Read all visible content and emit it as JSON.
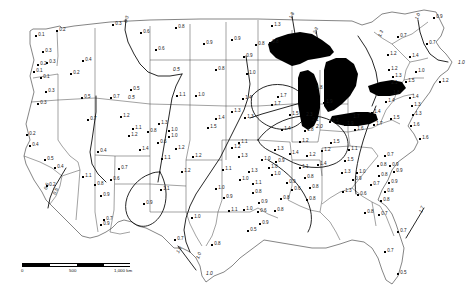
{
  "figure": {
    "kind": "contour-map",
    "region": "Contiguous United States",
    "background_color": "#ffffff",
    "line_color": "#333333",
    "contour_color": "#000000",
    "lake_fill_color": "#000000",
    "marker_color": "#000000"
  },
  "scale_bar": {
    "label_zero": "0",
    "label_mid": "500",
    "label_max": "1,000 km"
  },
  "chart_data": {
    "type": "scatter",
    "title": "",
    "xlabel": "",
    "ylabel": "",
    "value_range": [
      0.1,
      2.3
    ],
    "contour_levels": [
      0.3,
      0.5,
      0.7,
      1.0,
      1.3,
      1.8,
      2.0,
      2.1,
      2.3
    ],
    "contour_labels": [
      {
        "text": "0.3",
        "x": 124,
        "y": 22,
        "rot": -72
      },
      {
        "text": "0.5",
        "x": 173,
        "y": 68,
        "rot": 0
      },
      {
        "text": "0.5",
        "x": 128,
        "y": 96,
        "rot": 0
      },
      {
        "text": "0.5",
        "x": 53,
        "y": 194,
        "rot": -70
      },
      {
        "text": "0.5",
        "x": 44,
        "y": 189,
        "rot": -70
      },
      {
        "text": "1.0",
        "x": 176,
        "y": 252,
        "rot": -62
      },
      {
        "text": "1.0",
        "x": 196,
        "y": 258,
        "rot": -66
      },
      {
        "text": "1.0",
        "x": 206,
        "y": 272,
        "rot": 0
      },
      {
        "text": "1.8",
        "x": 289,
        "y": 18,
        "rot": -68
      },
      {
        "text": "2.3",
        "x": 313,
        "y": 33,
        "rot": -68
      },
      {
        "text": "1.3",
        "x": 378,
        "y": 36,
        "rot": -66
      },
      {
        "text": "1.0",
        "x": 415,
        "y": 19,
        "rot": -70
      },
      {
        "text": "1.0",
        "x": 458,
        "y": 61,
        "rot": 0
      },
      {
        "text": "1.7",
        "x": 419,
        "y": 212,
        "rot": -70
      },
      {
        "text": "2.0",
        "x": 316,
        "y": 125,
        "rot": 0
      },
      {
        "text": "2.1",
        "x": 312,
        "y": 118,
        "rot": 0
      }
    ],
    "points": [
      {
        "label": "0.1",
        "x": 36,
        "y": 36
      },
      {
        "label": "0.2",
        "x": 57,
        "y": 31
      },
      {
        "label": "0.3",
        "x": 43,
        "y": 52
      },
      {
        "label": "0.2",
        "x": 38,
        "y": 65
      },
      {
        "label": "0.3",
        "x": 47,
        "y": 63
      },
      {
        "label": "0.1",
        "x": 34,
        "y": 72
      },
      {
        "label": "0.1",
        "x": 41,
        "y": 78
      },
      {
        "label": "0.4",
        "x": 83,
        "y": 61
      },
      {
        "label": "0.2",
        "x": 71,
        "y": 74
      },
      {
        "label": "0.3",
        "x": 46,
        "y": 92
      },
      {
        "label": "0.3",
        "x": 38,
        "y": 104
      },
      {
        "label": "0.5",
        "x": 82,
        "y": 98
      },
      {
        "label": "0.7",
        "x": 111,
        "y": 98
      },
      {
        "label": "0.2",
        "x": 27,
        "y": 135
      },
      {
        "label": "0.4",
        "x": 30,
        "y": 146
      },
      {
        "label": "0.7",
        "x": 88,
        "y": 120
      },
      {
        "label": "0.4",
        "x": 98,
        "y": 152
      },
      {
        "label": "0.5",
        "x": 45,
        "y": 160
      },
      {
        "label": "0.4",
        "x": 55,
        "y": 168
      },
      {
        "label": "0.2",
        "x": 47,
        "y": 186
      },
      {
        "label": "0.9",
        "x": 101,
        "y": 196
      },
      {
        "label": "0.7",
        "x": 104,
        "y": 220
      },
      {
        "label": "0.8",
        "x": 95,
        "y": 185
      },
      {
        "label": "1.1",
        "x": 83,
        "y": 177
      },
      {
        "label": "0.7",
        "x": 119,
        "y": 169
      },
      {
        "label": "0.6",
        "x": 111,
        "y": 180
      },
      {
        "label": "0.9",
        "x": 101,
        "y": 225
      },
      {
        "label": "0.3",
        "x": 113,
        "y": 25
      },
      {
        "label": "0.6",
        "x": 141,
        "y": 33
      },
      {
        "label": "0.8",
        "x": 176,
        "y": 28
      },
      {
        "label": "0.6",
        "x": 156,
        "y": 50
      },
      {
        "label": "0.5",
        "x": 131,
        "y": 90
      },
      {
        "label": "1.1",
        "x": 177,
        "y": 96
      },
      {
        "label": "1.0",
        "x": 196,
        "y": 96
      },
      {
        "label": "1.2",
        "x": 121,
        "y": 117
      },
      {
        "label": "1.3",
        "x": 159,
        "y": 124
      },
      {
        "label": "0.8",
        "x": 148,
        "y": 132
      },
      {
        "label": "1.0",
        "x": 169,
        "y": 131
      },
      {
        "label": "1.0",
        "x": 169,
        "y": 137
      },
      {
        "label": "0.6",
        "x": 158,
        "y": 143
      },
      {
        "label": "1.1",
        "x": 133,
        "y": 129
      },
      {
        "label": "1.2",
        "x": 129,
        "y": 136
      },
      {
        "label": "1.4",
        "x": 140,
        "y": 150
      },
      {
        "label": "1.2",
        "x": 176,
        "y": 149
      },
      {
        "label": "1.1",
        "x": 162,
        "y": 159
      },
      {
        "label": "1.2",
        "x": 193,
        "y": 157
      },
      {
        "label": "0.9",
        "x": 144,
        "y": 204
      },
      {
        "label": "1.1",
        "x": 161,
        "y": 190
      },
      {
        "label": "1.2",
        "x": 182,
        "y": 172
      },
      {
        "label": "1.0",
        "x": 192,
        "y": 218
      },
      {
        "label": "0.7",
        "x": 175,
        "y": 240
      },
      {
        "label": "0.8",
        "x": 212,
        "y": 245
      },
      {
        "label": "1.1",
        "x": 223,
        "y": 170
      },
      {
        "label": "1.3",
        "x": 239,
        "y": 157
      },
      {
        "label": "1.2",
        "x": 232,
        "y": 148
      },
      {
        "label": "1.0",
        "x": 216,
        "y": 189
      },
      {
        "label": "0.9",
        "x": 224,
        "y": 198
      },
      {
        "label": "1.0",
        "x": 240,
        "y": 180
      },
      {
        "label": "1.1",
        "x": 229,
        "y": 211
      },
      {
        "label": "1.0",
        "x": 244,
        "y": 210
      },
      {
        "label": "0.8",
        "x": 253,
        "y": 193
      },
      {
        "label": "1.5",
        "x": 208,
        "y": 128
      },
      {
        "label": "1.4",
        "x": 216,
        "y": 119
      },
      {
        "label": "1.3",
        "x": 232,
        "y": 112
      },
      {
        "label": "1.3",
        "x": 245,
        "y": 118
      },
      {
        "label": "0.8",
        "x": 216,
        "y": 70
      },
      {
        "label": "0.9",
        "x": 204,
        "y": 44
      },
      {
        "label": "0.9",
        "x": 232,
        "y": 40
      },
      {
        "label": "0.8",
        "x": 256,
        "y": 45
      },
      {
        "label": "0.9",
        "x": 244,
        "y": 57
      },
      {
        "label": "1.0",
        "x": 247,
        "y": 74
      },
      {
        "label": "1.3",
        "x": 272,
        "y": 26
      },
      {
        "label": "0.8",
        "x": 270,
        "y": 43
      },
      {
        "label": "1.4",
        "x": 243,
        "y": 99
      },
      {
        "label": "1.7",
        "x": 278,
        "y": 97
      },
      {
        "label": "1.7",
        "x": 272,
        "y": 105
      },
      {
        "label": "1.8",
        "x": 314,
        "y": 89
      },
      {
        "label": "1.9",
        "x": 324,
        "y": 103
      },
      {
        "label": "1.5",
        "x": 290,
        "y": 115
      },
      {
        "label": "2.3",
        "x": 304,
        "y": 116
      },
      {
        "label": "2.3",
        "x": 330,
        "y": 122
      },
      {
        "label": "1.8",
        "x": 305,
        "y": 131
      },
      {
        "label": "1.7",
        "x": 351,
        "y": 118
      },
      {
        "label": "1.9",
        "x": 345,
        "y": 125
      },
      {
        "label": "1.6",
        "x": 355,
        "y": 130
      },
      {
        "label": "1.5",
        "x": 331,
        "y": 143
      },
      {
        "label": "1.2",
        "x": 300,
        "y": 142
      },
      {
        "label": "1.4",
        "x": 282,
        "y": 130
      },
      {
        "label": "1.1",
        "x": 239,
        "y": 143
      },
      {
        "label": "1.3",
        "x": 275,
        "y": 150
      },
      {
        "label": "1.4",
        "x": 290,
        "y": 154
      },
      {
        "label": "1.2",
        "x": 307,
        "y": 156
      },
      {
        "label": "1.0",
        "x": 262,
        "y": 160
      },
      {
        "label": "0.9",
        "x": 276,
        "y": 162
      },
      {
        "label": "1.1",
        "x": 300,
        "y": 168
      },
      {
        "label": "1.0",
        "x": 269,
        "y": 168
      },
      {
        "label": "1.0",
        "x": 272,
        "y": 175
      },
      {
        "label": "0.8",
        "x": 305,
        "y": 178
      },
      {
        "label": "0.9",
        "x": 287,
        "y": 183
      },
      {
        "label": "0.8",
        "x": 310,
        "y": 188
      },
      {
        "label": "0.6",
        "x": 292,
        "y": 190
      },
      {
        "label": "0.8",
        "x": 281,
        "y": 199
      },
      {
        "label": "0.8",
        "x": 307,
        "y": 200
      },
      {
        "label": "0.8",
        "x": 275,
        "y": 211
      },
      {
        "label": "0.9",
        "x": 260,
        "y": 224
      },
      {
        "label": "0.9",
        "x": 259,
        "y": 203
      },
      {
        "label": "0.6",
        "x": 258,
        "y": 212
      },
      {
        "label": "0.5",
        "x": 248,
        "y": 231
      },
      {
        "label": "1.4",
        "x": 318,
        "y": 165
      },
      {
        "label": "1.5",
        "x": 345,
        "y": 161
      },
      {
        "label": "1.3",
        "x": 342,
        "y": 173
      },
      {
        "label": "1.3",
        "x": 343,
        "y": 192
      },
      {
        "label": "1.0",
        "x": 357,
        "y": 173
      },
      {
        "label": "0.9",
        "x": 353,
        "y": 180
      },
      {
        "label": "0.7",
        "x": 371,
        "y": 185
      },
      {
        "label": "0.6",
        "x": 358,
        "y": 195
      },
      {
        "label": "0.8",
        "x": 385,
        "y": 192
      },
      {
        "label": "0.8",
        "x": 379,
        "y": 176
      },
      {
        "label": "0.9",
        "x": 389,
        "y": 183
      },
      {
        "label": "0.9",
        "x": 394,
        "y": 172
      },
      {
        "label": "0.9",
        "x": 390,
        "y": 166
      },
      {
        "label": "0.8",
        "x": 378,
        "y": 166
      },
      {
        "label": "0.7",
        "x": 385,
        "y": 156
      },
      {
        "label": "0.8",
        "x": 381,
        "y": 201
      },
      {
        "label": "0.8",
        "x": 365,
        "y": 213
      },
      {
        "label": "0.7",
        "x": 379,
        "y": 215
      },
      {
        "label": "0.7",
        "x": 398,
        "y": 232
      },
      {
        "label": "0.7",
        "x": 385,
        "y": 252
      },
      {
        "label": "0.5",
        "x": 398,
        "y": 274
      },
      {
        "label": "0.9",
        "x": 434,
        "y": 18
      },
      {
        "label": "0.7",
        "x": 398,
        "y": 37
      },
      {
        "label": "0.7",
        "x": 427,
        "y": 44
      },
      {
        "label": "1.2",
        "x": 388,
        "y": 55
      },
      {
        "label": "1.2",
        "x": 389,
        "y": 70
      },
      {
        "label": "1.3",
        "x": 393,
        "y": 77
      },
      {
        "label": "1.4",
        "x": 410,
        "y": 57
      },
      {
        "label": "1.0",
        "x": 416,
        "y": 72
      },
      {
        "label": "1.2",
        "x": 440,
        "y": 82
      },
      {
        "label": "1.5",
        "x": 406,
        "y": 82
      },
      {
        "label": "2.1",
        "x": 389,
        "y": 84
      },
      {
        "label": "1.8",
        "x": 391,
        "y": 94
      },
      {
        "label": "1.4",
        "x": 386,
        "y": 102
      },
      {
        "label": "1.4",
        "x": 410,
        "y": 98
      },
      {
        "label": "1.3",
        "x": 412,
        "y": 106
      },
      {
        "label": "1.3",
        "x": 413,
        "y": 115
      },
      {
        "label": "1.5",
        "x": 391,
        "y": 119
      },
      {
        "label": "1.4",
        "x": 372,
        "y": 113
      },
      {
        "label": "1.7",
        "x": 374,
        "y": 125
      },
      {
        "label": "1.6",
        "x": 411,
        "y": 126
      },
      {
        "label": "1.6",
        "x": 420,
        "y": 139
      },
      {
        "label": "1.1",
        "x": 349,
        "y": 150
      },
      {
        "label": "1.2",
        "x": 322,
        "y": 151
      },
      {
        "label": "1.1",
        "x": 253,
        "y": 184
      },
      {
        "label": "1.3",
        "x": 249,
        "y": 172
      }
    ]
  }
}
